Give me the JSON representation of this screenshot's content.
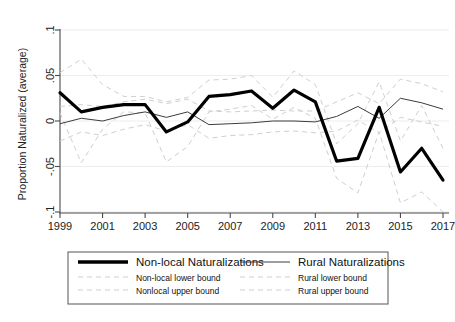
{
  "chart_data": {
    "type": "line",
    "title": "",
    "xlabel": "",
    "ylabel": "Proportion Naturalized (average)",
    "xlim": [
      1999,
      2017
    ],
    "ylim": [
      -0.1,
      0.1
    ],
    "grid": true,
    "legend_position": "below-plot",
    "x": [
      1999,
      2000,
      2001,
      2002,
      2003,
      2004,
      2005,
      2006,
      2007,
      2008,
      2009,
      2010,
      2011,
      2012,
      2013,
      2014,
      2015,
      2016,
      2017
    ],
    "xticks": [
      "1999",
      "2001",
      "2003",
      "2005",
      "2007",
      "2009",
      "2011",
      "2013",
      "2015",
      "2017"
    ],
    "yticks": [
      ".1",
      ".05",
      "0",
      "-.05",
      "-.1"
    ],
    "series": [
      {
        "name": "Non-local Naturalizations",
        "style": "solid-thick",
        "color": "#000000",
        "values": [
          0.031,
          0.01,
          0.015,
          0.018,
          0.018,
          -0.012,
          -0.001,
          0.027,
          0.029,
          0.033,
          0.014,
          0.034,
          0.021,
          -0.044,
          -0.041,
          0.015,
          -0.056,
          -0.03,
          -0.065
        ]
      },
      {
        "name": "Rural Naturalizations",
        "style": "solid-thin",
        "color": "#3c3c3c",
        "values": [
          -0.003,
          0.003,
          0.0,
          0.006,
          0.01,
          0.004,
          0.01,
          -0.004,
          -0.003,
          -0.002,
          0.0,
          0.0,
          -0.001,
          0.005,
          0.016,
          0.003,
          0.025,
          0.02,
          0.013
        ]
      },
      {
        "name": "Non-local lower bound",
        "style": "dashed",
        "color": "#cfcfcf",
        "values": [
          0.009,
          -0.046,
          -0.009,
          0.01,
          0.009,
          -0.045,
          -0.028,
          0.01,
          0.013,
          0.017,
          0.002,
          0.015,
          0.003,
          -0.063,
          -0.079,
          -0.012,
          -0.09,
          -0.078,
          -0.1
        ]
      },
      {
        "name": "Nonlocal upper bound",
        "style": "dashed",
        "color": "#cfcfcf",
        "values": [
          0.053,
          0.068,
          0.04,
          0.027,
          0.027,
          0.021,
          0.026,
          0.045,
          0.046,
          0.05,
          0.026,
          0.055,
          0.04,
          -0.025,
          -0.003,
          0.043,
          -0.022,
          0.017,
          -0.03
        ]
      },
      {
        "name": "Rural lower bound",
        "style": "dashed",
        "color": "#cfcfcf",
        "values": [
          -0.022,
          -0.012,
          -0.016,
          -0.009,
          -0.004,
          -0.011,
          -0.004,
          -0.019,
          -0.016,
          -0.015,
          -0.012,
          -0.011,
          -0.013,
          -0.011,
          0.001,
          -0.013,
          0.004,
          -0.001,
          -0.006
        ]
      },
      {
        "name": "Rural upper bound",
        "style": "dashed",
        "color": "#cfcfcf",
        "values": [
          0.016,
          0.018,
          0.016,
          0.021,
          0.024,
          0.019,
          0.024,
          0.011,
          0.01,
          0.011,
          0.012,
          0.011,
          0.011,
          0.021,
          0.031,
          0.019,
          0.046,
          0.041,
          0.032
        ]
      }
    ]
  },
  "legend": {
    "entries": [
      {
        "label": "Non-local Naturalizations",
        "style": "solid-thick",
        "size": "big"
      },
      {
        "label": "Rural Naturalizations",
        "style": "solid-thin",
        "size": "big"
      },
      {
        "label": "Non-local lower bound",
        "style": "dashed",
        "size": "small"
      },
      {
        "label": "Rural lower bound",
        "style": "dashed",
        "size": "small"
      },
      {
        "label": "Nonlocal upper bound",
        "style": "dashed",
        "size": "small"
      },
      {
        "label": "Rural upper bound",
        "style": "dashed",
        "size": "small"
      }
    ]
  },
  "colors": {
    "main_series": "#000000",
    "secondary_series": "#3c3c3c",
    "bounds": "#cfcfcf",
    "axis": "#4a4a4a",
    "grid": "#ebebeb",
    "background": "#ffffff"
  }
}
